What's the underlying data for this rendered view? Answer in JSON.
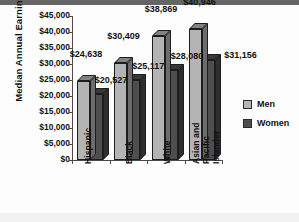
{
  "chart_data": {
    "type": "bar",
    "title": "",
    "subtitle": "",
    "xlabel": "",
    "ylabel": "Median Annual Earnings",
    "ylim": [
      0,
      45000
    ],
    "ytick_step": 5000,
    "grid": false,
    "three_d": true,
    "legend_position": "right",
    "categories": [
      "Hispanic",
      "Black",
      "White",
      "Asian and Pacific Islander"
    ],
    "category_lines": [
      [
        "Hispanic"
      ],
      [
        "Black"
      ],
      [
        "White"
      ],
      [
        "Asian and",
        "Pacific",
        "Islander"
      ]
    ],
    "series": [
      {
        "name": "Men",
        "color": "#b4b4b4",
        "values": [
          24638,
          30409,
          38869,
          40946
        ],
        "labels": [
          "$24,638",
          "$30,409",
          "$38,869",
          "$40,946"
        ]
      },
      {
        "name": "Women",
        "color": "#4e4e4e",
        "values": [
          20527,
          25117,
          28080,
          31156
        ],
        "labels": [
          "$20,527",
          "$25,117",
          "$28,080",
          "$31,156"
        ]
      }
    ],
    "yticks": [
      {
        "value": 0,
        "label": "$0"
      },
      {
        "value": 5000,
        "label": "$5,000"
      },
      {
        "value": 10000,
        "label": "$10,000"
      },
      {
        "value": 15000,
        "label": "$15,000"
      },
      {
        "value": 20000,
        "label": "$20,000"
      },
      {
        "value": 25000,
        "label": "$25,000"
      },
      {
        "value": 30000,
        "label": "$30,000"
      },
      {
        "value": 35000,
        "label": "$35,000"
      },
      {
        "value": 40000,
        "label": "$40,000"
      },
      {
        "value": 45000,
        "label": "$45,000"
      }
    ],
    "legend": [
      {
        "label": "Men",
        "color": "#b4b4b4"
      },
      {
        "label": "Women",
        "color": "#4e4e4e"
      }
    ]
  }
}
